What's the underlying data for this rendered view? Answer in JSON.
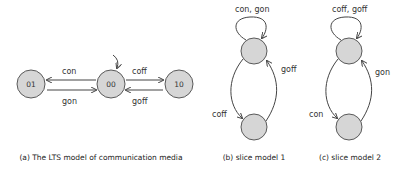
{
  "diagrams": [
    {
      "id": "a",
      "caption": "(a) The LTS model of communication media",
      "nodes": [
        {
          "label": "01"
        },
        {
          "label": "00"
        },
        {
          "label": "10"
        }
      ],
      "edges": [
        {
          "from": "00",
          "to": "01",
          "label": "con"
        },
        {
          "from": "01",
          "to": "00",
          "label": "gon"
        },
        {
          "from": "00",
          "to": "10",
          "label": "coff"
        },
        {
          "from": "10",
          "to": "00",
          "label": "goff"
        }
      ],
      "initial_state": "00"
    },
    {
      "id": "b",
      "caption": "(b) slice model 1",
      "edges": [
        {
          "from": "top",
          "to": "top",
          "label": "con, gon"
        },
        {
          "from": "top",
          "to": "bottom",
          "label": "coff"
        },
        {
          "from": "bottom",
          "to": "top",
          "label": "goff"
        }
      ]
    },
    {
      "id": "c",
      "caption": "(c) slice model 2",
      "edges": [
        {
          "from": "top",
          "to": "top",
          "label": "coff, goff"
        },
        {
          "from": "top",
          "to": "bottom",
          "label": "con"
        },
        {
          "from": "bottom",
          "to": "top",
          "label": "gon"
        }
      ]
    }
  ],
  "colors": {
    "node_fill": "#d6d6d6",
    "node_stroke": "#5a5a5a",
    "edge": "#444444",
    "text": "#333333"
  }
}
